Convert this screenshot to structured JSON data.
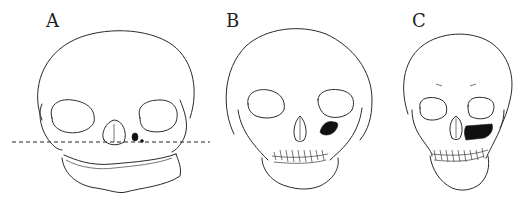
{
  "figure": {
    "type": "line-art illustration",
    "panels": [
      {
        "label": "A",
        "description": "Newborn skull with dashed horizontal reference line across the face; tiny dark maxillary sinus beside nasal aperture"
      },
      {
        "label": "B",
        "description": "Child skull with deciduous teeth; medium dark maxillary sinus below left orbit"
      },
      {
        "label": "C",
        "description": "Older child skull; larger dark maxillary sinus below left orbit"
      }
    ],
    "colors": {
      "background": "#ffffff",
      "ink": "#2a2a2a",
      "sinus_fill": "#111111"
    }
  }
}
